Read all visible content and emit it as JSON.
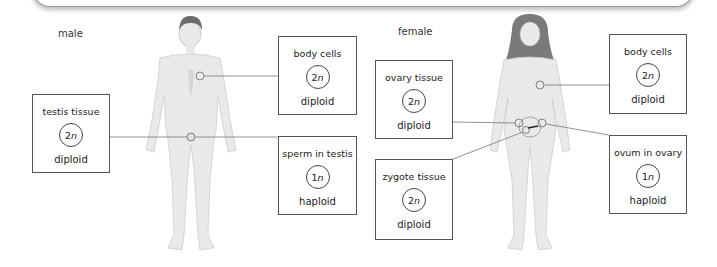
{
  "labels": {
    "male": "male",
    "female": "female"
  },
  "male": {
    "boxes": [
      {
        "id": "testis-tissue",
        "title": "testis tissue",
        "number": "2",
        "variable": "n",
        "ploidy": "diploid"
      },
      {
        "id": "male-body-cells",
        "title": "body cells",
        "number": "2",
        "variable": "n",
        "ploidy": "diploid"
      },
      {
        "id": "sperm-in-testis",
        "title": "sperm in testis",
        "number": "1",
        "variable": "n",
        "ploidy": "haploid"
      }
    ]
  },
  "female": {
    "boxes": [
      {
        "id": "ovary-tissue",
        "title": "ovary tissue",
        "number": "2",
        "variable": "n",
        "ploidy": "diploid"
      },
      {
        "id": "female-body-cells",
        "title": "body cells",
        "number": "2",
        "variable": "n",
        "ploidy": "diploid"
      },
      {
        "id": "zygote-tissue",
        "title": "zygote tissue",
        "number": "2",
        "variable": "n",
        "ploidy": "diploid"
      },
      {
        "id": "ovum-in-ovary",
        "title": "ovum in ovary",
        "number": "1",
        "variable": "n",
        "ploidy": "haploid"
      }
    ]
  },
  "colors": {
    "line": "#777777",
    "border": "#555555",
    "body": "#e6e6e6",
    "hair_male": "#6b6b6b",
    "hair_female": "#7a7a7a"
  }
}
